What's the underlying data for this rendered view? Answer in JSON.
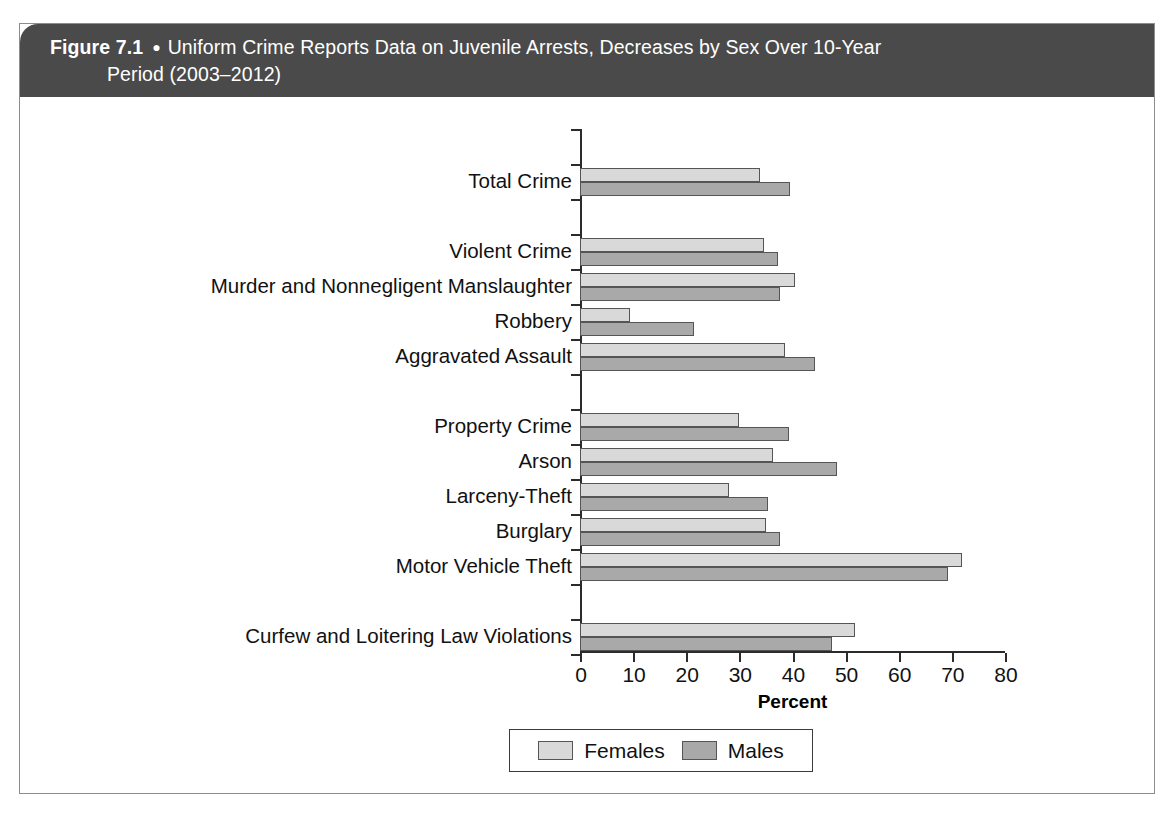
{
  "figure": {
    "label": "Figure 7.1",
    "bullet": "●",
    "title_line1": "Uniform Crime Reports Data on Juvenile Arrests, Decreases by Sex Over 10-Year",
    "title_line2": "Period (2003–2012)"
  },
  "colors": {
    "header_background": "#4a4a4a",
    "header_text": "#ffffff",
    "females_bar": "#d9d9d9",
    "males_bar": "#a9a9a9",
    "axis": "#2b2b2b",
    "frame": "#8d8d8d"
  },
  "legend": {
    "position": "bottom-center",
    "items": [
      {
        "label": "Females",
        "swatch": "females_bar"
      },
      {
        "label": "Males",
        "swatch": "males_bar"
      }
    ]
  },
  "chart_data": {
    "type": "bar",
    "orientation": "horizontal",
    "title": "Uniform Crime Reports Data on Juvenile Arrests, Decreases by Sex Over 10-Year Period (2003–2012)",
    "xlabel": "Percent",
    "ylabel": "",
    "xlim": [
      0,
      80
    ],
    "xticks": [
      0,
      10,
      20,
      30,
      40,
      50,
      60,
      70,
      80
    ],
    "xticklabels": [
      "0",
      "10",
      "20",
      "30",
      "40",
      "50",
      "60",
      "70",
      "80"
    ],
    "grid": false,
    "legend_position": "bottom-center",
    "categories": [
      "Total Crime",
      "Violent Crime",
      "Murder and Nonnegligent Manslaughter",
      "Robbery",
      "Aggravated Assault",
      "Property Crime",
      "Arson",
      "Larceny-Theft",
      "Burglary",
      "Motor Vehicle Theft",
      "Curfew and Loitering Law Violations"
    ],
    "series": [
      {
        "name": "Females",
        "color": "#d9d9d9",
        "values": [
          33.8,
          34.7,
          40.4,
          9.4,
          38.5,
          30.0,
          36.4,
          28.0,
          35.0,
          71.9,
          51.7
        ]
      },
      {
        "name": "Males",
        "color": "#a9a9a9",
        "values": [
          39.6,
          37.2,
          37.6,
          21.5,
          44.2,
          39.3,
          48.3,
          35.3,
          37.7,
          69.2,
          47.5
        ]
      }
    ],
    "group_breaks_after": [
      "Total Crime",
      "Aggravated Assault",
      "Motor Vehicle Theft"
    ]
  }
}
